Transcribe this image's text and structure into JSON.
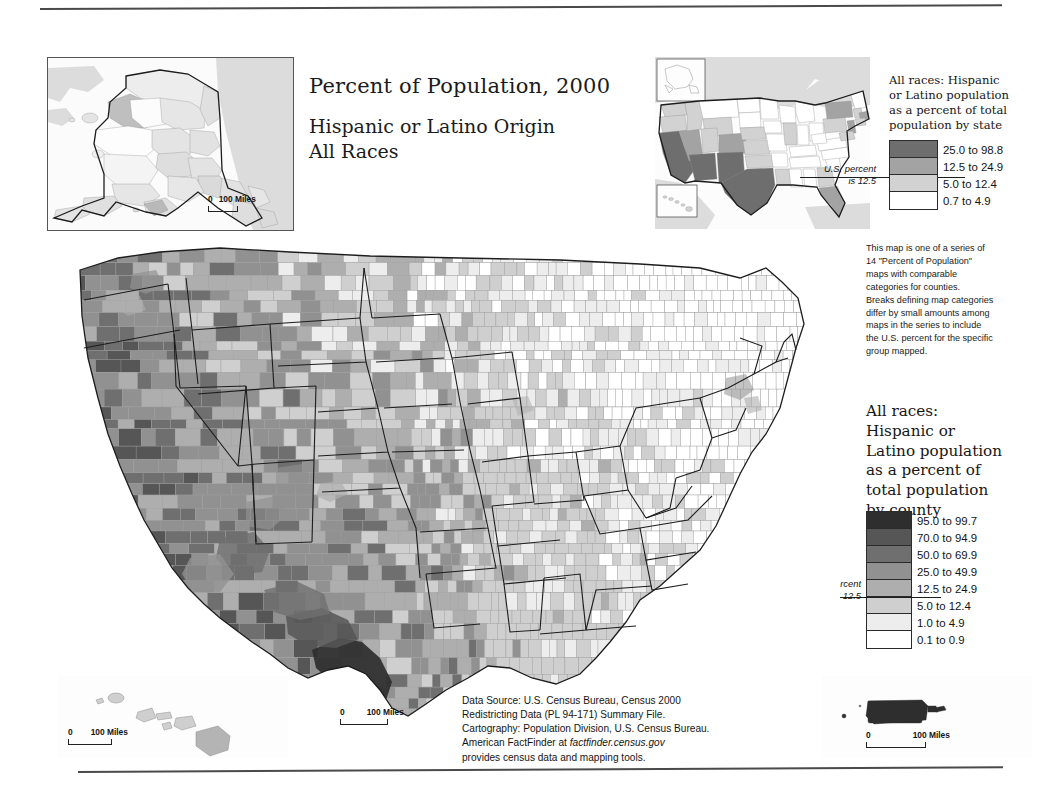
{
  "document": {
    "title_line1": "Percent of Population, 2000",
    "title_line2": "Hispanic or Latino Origin",
    "title_line3": "All Races"
  },
  "state_legend": {
    "title": "All races: Hispanic or Latino population as a percent of total population by state",
    "title_lines": [
      "All races: Hispanic",
      "or Latino population",
      "as a percent of total",
      "population by state"
    ],
    "us_percent_note_line1": "U.S. percent",
    "us_percent_note_line2": "is 12.5",
    "classes": [
      {
        "label": "25.0 to 98.8",
        "color": "#6e6e6e"
      },
      {
        "label": "12.5 to 24.9",
        "color": "#a3a3a3"
      },
      {
        "label": "5.0 to 12.4",
        "color": "#d2d2d2"
      },
      {
        "label": "0.7 to 4.9",
        "color": "#ffffff"
      }
    ]
  },
  "series_note": {
    "lines": [
      "This map is one of a series of",
      "14 \"Percent of Population\"",
      "maps with comparable",
      "categories for counties.",
      "Breaks defining map categories",
      "differ by small amounts among",
      "maps in the series to include",
      "the U.S. percent for the specific",
      "group mapped."
    ]
  },
  "county_legend": {
    "title_lines": [
      "All races:",
      "Hispanic or",
      "Latino population",
      "as a percent of",
      "total population",
      "by county"
    ],
    "us_percent_note_line1": "U.S. percent",
    "us_percent_note_line2": "is 12.5",
    "classes": [
      {
        "label": "95.0 to 99.7",
        "color": "#2e2e2e"
      },
      {
        "label": "70.0 to 94.9",
        "color": "#565656"
      },
      {
        "label": "50.0 to 69.9",
        "color": "#6f6f6f"
      },
      {
        "label": "25.0 to 49.9",
        "color": "#919191"
      },
      {
        "label": "12.5 to 24.9",
        "color": "#aeaeae"
      },
      {
        "label": "5.0 to 12.4",
        "color": "#cfcfcf"
      },
      {
        "label": "1.0 to 4.9",
        "color": "#ededed"
      },
      {
        "label": "0.1 to 0.9",
        "color": "#ffffff"
      }
    ]
  },
  "source_note": {
    "line1": "Data Source: U.S. Census Bureau, Census 2000",
    "line2": "Redistricting Data (PL 94-171) Summary File.",
    "line3": "Cartography: Population Division, U.S. Census Bureau.",
    "line4_prefix": "American FactFinder at ",
    "line4_italic": "factfinder.census.gov",
    "line5": "provides census data and mapping tools."
  },
  "scalebars": {
    "alaska": {
      "zero": "0",
      "label": "100 Miles"
    },
    "hawaii": {
      "zero": "0",
      "label": "100 Miles"
    },
    "conus": {
      "zero": "0",
      "label": "100 Miles"
    },
    "puerto_rico": {
      "zero": "0",
      "label": "100 Miles"
    }
  },
  "chart_data": {
    "type": "heatmap",
    "map_kind": "choropleth",
    "national_value_percent": 12.5,
    "county_class_breaks": [
      0.1,
      1.0,
      5.0,
      12.5,
      25.0,
      50.0,
      70.0,
      95.0,
      99.7
    ],
    "state_class_breaks": [
      0.7,
      5.0,
      12.5,
      25.0,
      98.8
    ],
    "insets": [
      "Alaska",
      "Hawaii",
      "Puerto Rico",
      "United States by state"
    ],
    "state_values_class": {
      "New Mexico": "25.0 to 98.8",
      "California": "25.0 to 98.8",
      "Texas": "25.0 to 98.8",
      "Arizona": "25.0 to 98.8",
      "Nevada": "12.5 to 24.9",
      "Colorado": "12.5 to 24.9",
      "Florida": "12.5 to 24.9",
      "New York": "12.5 to 24.9",
      "New Jersey": "12.5 to 24.9",
      "Illinois": "5.0 to 12.4",
      "Connecticut": "5.0 to 12.4",
      "Rhode Island": "5.0 to 12.4",
      "Massachusetts": "5.0 to 12.4",
      "Oregon": "5.0 to 12.4",
      "Washington": "5.0 to 12.4",
      "Idaho": "5.0 to 12.4",
      "Utah": "5.0 to 12.4",
      "Kansas": "5.0 to 12.4",
      "Nebraska": "5.0 to 12.4",
      "Oklahoma": "5.0 to 12.4",
      "Wyoming": "5.0 to 12.4",
      "Alaska": "0.7 to 4.9",
      "Hawaii": "5.0 to 12.4"
    },
    "notable_regions": [
      {
        "region": "South Texas border counties",
        "class": "95.0 to 99.7"
      },
      {
        "region": "Puerto Rico",
        "class": "95.0 to 99.7"
      },
      {
        "region": "Southern California / Imperial Valley",
        "class": "50.0 to 69.9"
      },
      {
        "region": "Northern New Mexico",
        "class": "50.0 to 69.9"
      },
      {
        "region": "Appalachia and Deep South",
        "class": "0.1 to 0.9"
      }
    ]
  }
}
